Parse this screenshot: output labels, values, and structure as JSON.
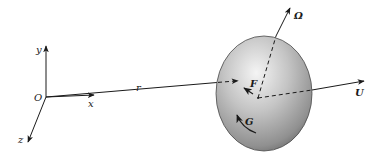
{
  "diagram": {
    "type": "physics-free-body",
    "axes": {
      "origin_label": "O",
      "x_label": "x",
      "y_label": "y",
      "z_label": "z"
    },
    "vectors": {
      "position_label": "r",
      "angular_velocity_label": "Ω",
      "velocity_label": "U",
      "force_label": "F",
      "torque_label": "G"
    },
    "colors": {
      "ink": "#1a1a1a",
      "body_light": "#f2f2f2",
      "body_mid": "#b8b8b8",
      "body_dark": "#6e6e6e",
      "background": "#ffffff"
    }
  }
}
